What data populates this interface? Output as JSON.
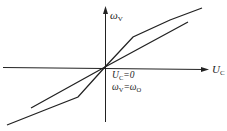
{
  "diagram": {
    "y_axis": {
      "symbol": "ω",
      "subscript": "V"
    },
    "x_axis": {
      "symbol": "U",
      "subscript": "C"
    },
    "annotation": {
      "line1": {
        "symbol": "U",
        "subscript": "C",
        "rest": "=0"
      },
      "line2": {
        "symbol": "ω",
        "subscript": "V",
        "eq": "=ω",
        "subscript2": "O"
      }
    },
    "curves": [
      {
        "name": "piecewise-curve",
        "points": [
          [
            7,
            125
          ],
          [
            50,
            108
          ],
          [
            78,
            97
          ],
          [
            105,
            67
          ],
          [
            133,
            37
          ],
          [
            170,
            20
          ],
          [
            202,
            8
          ]
        ]
      },
      {
        "name": "linear-curve",
        "points": [
          [
            31,
            108
          ],
          [
            105,
            67
          ],
          [
            188,
            22
          ]
        ]
      }
    ],
    "line_color": "#222222"
  }
}
